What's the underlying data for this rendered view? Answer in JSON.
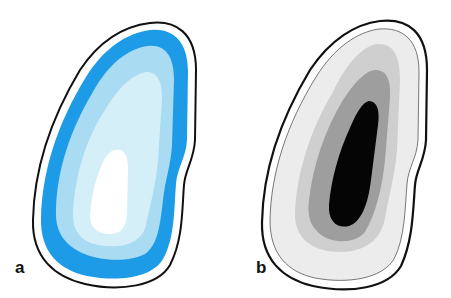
{
  "figure": {
    "panels": [
      {
        "id": "a",
        "label": "a",
        "palette": {
          "outline": "#111111",
          "band_outer": "#1e9be6",
          "layer_1": "#a9dbf3",
          "layer_2": "#d5eff9",
          "core": "#ffffff"
        }
      },
      {
        "id": "b",
        "label": "b",
        "palette": {
          "outline": "#111111",
          "inner_line": "#555555",
          "layer_1": "#ececec",
          "layer_2": "#cfcfcf",
          "layer_3": "#9e9e9e",
          "core": "#050505"
        }
      }
    ]
  }
}
